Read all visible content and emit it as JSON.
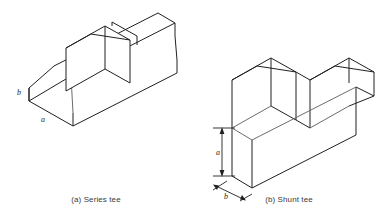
{
  "page": {
    "background_color": "#ffffff",
    "line_color": "#231f20",
    "soft_line_color": "#5c5a5b",
    "width": 385,
    "height": 216
  },
  "figures": [
    {
      "id": "series-tee",
      "caption": "(a) Series tee",
      "labels": {
        "height_label": "b",
        "width_label": "a"
      }
    },
    {
      "id": "shunt-tee",
      "caption": "(b) Shunt tee",
      "labels": {
        "height_label": "a",
        "width_label": "b"
      }
    }
  ]
}
